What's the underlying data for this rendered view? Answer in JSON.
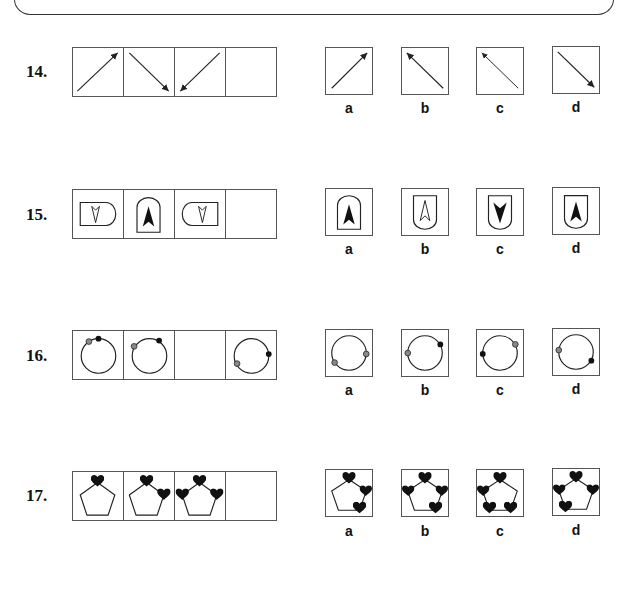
{
  "questions": [
    {
      "number": "14.",
      "sequence": [
        "arrow-up-right",
        "arrow-down-right",
        "arrow-down-left",
        "blank"
      ],
      "options": [
        {
          "label": "a",
          "figure": "arrow-up-right"
        },
        {
          "label": "b",
          "figure": "arrow-up-left-double"
        },
        {
          "label": "c",
          "figure": "arrow-up-left"
        },
        {
          "label": "d",
          "figure": "arrow-down-right"
        }
      ]
    },
    {
      "number": "15.",
      "sequence": [
        "rounded-right-shield-outline-down",
        "rounded-top-shield-filled-up",
        "rounded-left-shield-outline-down",
        "blank"
      ],
      "options": [
        {
          "label": "a",
          "figure": "rounded-top-shield-filled-up"
        },
        {
          "label": "b",
          "figure": "rounded-bottom-shield-outline-up"
        },
        {
          "label": "c",
          "figure": "rounded-bottom-shield-filled-down"
        },
        {
          "label": "d",
          "figure": "rounded-bottom-shield-filled-up"
        }
      ]
    },
    {
      "number": "16.",
      "sequence": [
        "circle-grey-upper-left-black-top",
        "circle-grey-left-black-upper-right",
        "blank",
        "circle-grey-lower-left-black-right"
      ],
      "options": [
        {
          "label": "a",
          "figure": "circle-grey-lower-left-grey-right"
        },
        {
          "label": "b",
          "figure": "circle-grey-left-black-upper-right"
        },
        {
          "label": "c",
          "figure": "circle-black-left-grey-upper-right"
        },
        {
          "label": "d",
          "figure": "circle-grey-left-black-lower-right"
        }
      ]
    },
    {
      "number": "17.",
      "sequence": [
        "pentagon-1-heart",
        "pentagon-2-hearts",
        "pentagon-3-hearts",
        "blank"
      ],
      "options": [
        {
          "label": "a",
          "figure": "pentagon-3-hearts-top-right-bottom"
        },
        {
          "label": "b",
          "figure": "pentagon-4-hearts"
        },
        {
          "label": "c",
          "figure": "pentagon-4-hearts-bottom"
        },
        {
          "label": "d",
          "figure": "pentagon-4-hearts-alt"
        }
      ]
    }
  ]
}
